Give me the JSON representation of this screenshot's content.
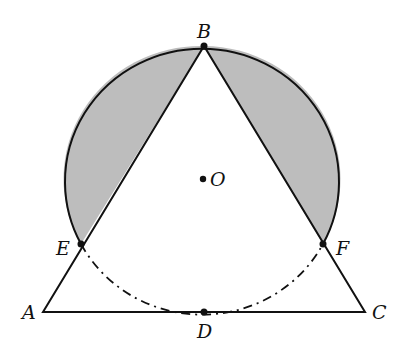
{
  "diagram": {
    "type": "geometry",
    "colors": {
      "stroke": "#111111",
      "shade": "#bdbdbd",
      "background": "#ffffff"
    },
    "points": {
      "A": {
        "label": "A",
        "x": 43,
        "y": 312
      },
      "B": {
        "label": "B",
        "x": 204,
        "y": 46
      },
      "C": {
        "label": "C",
        "x": 365,
        "y": 312
      },
      "D": {
        "label": "D",
        "x": 204,
        "y": 312
      },
      "E": {
        "label": "E",
        "x": 81,
        "y": 244
      },
      "F": {
        "label": "F",
        "x": 323,
        "y": 244
      },
      "O": {
        "label": "O",
        "x": 203,
        "y": 179
      }
    },
    "circle": {
      "center": "O",
      "rx": 137,
      "ry": 133,
      "dashed_arc": "E-D-F (dash-dot)"
    },
    "shaded_regions": [
      "segment between chord BE and arc BE",
      "segment between chord BF and arc BF"
    ]
  }
}
